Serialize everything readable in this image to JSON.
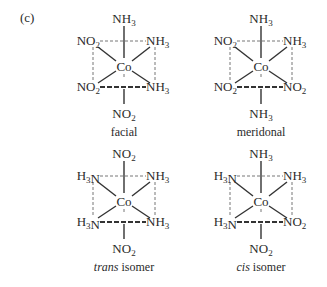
{
  "panel_label": "(c)",
  "isomers": [
    {
      "id": "facial",
      "caption": "facial",
      "caption_italic": "",
      "center": "Co",
      "top": "NH3",
      "bottom": "NO2",
      "upper_left": "NO2",
      "upper_right": "NH3",
      "lower_left": "NO2",
      "lower_right": "NH3"
    },
    {
      "id": "meridonal",
      "caption": "meridonal",
      "caption_italic": "",
      "center": "Co",
      "top": "NH3",
      "bottom": "NH3",
      "upper_left": "NO2",
      "upper_right": "NH3",
      "lower_left": "NO2",
      "lower_right": "NO2"
    },
    {
      "id": "trans",
      "caption": " isomer",
      "caption_italic": "trans",
      "center": "Co",
      "top": "NO2",
      "bottom": "NO2",
      "upper_left": "H3N",
      "upper_right": "NH3",
      "lower_left": "H3N",
      "lower_right": "NH3"
    },
    {
      "id": "cis",
      "caption": " isomer",
      "caption_italic": "cis",
      "center": "Co",
      "top": "NH3",
      "bottom": "NO2",
      "upper_left": "H3N",
      "upper_right": "NH3",
      "lower_left": "H3N",
      "lower_right": "NO2"
    }
  ]
}
